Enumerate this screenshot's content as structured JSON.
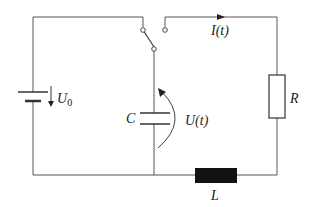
{
  "diagram": {
    "type": "circuit",
    "components": {
      "source": {
        "label": "U",
        "subscript": "0"
      },
      "capacitor": {
        "label": "C"
      },
      "voltage": {
        "label": "U(t)"
      },
      "current": {
        "label": "I(t)"
      },
      "resistor": {
        "label": "R"
      },
      "inductor": {
        "label": "L"
      },
      "switch": {
        "label": ""
      }
    },
    "colors": {
      "wire": "#555555",
      "inductor": "#111111",
      "text": "#222222"
    }
  }
}
